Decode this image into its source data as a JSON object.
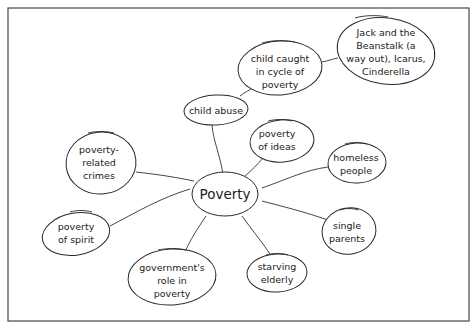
{
  "diagram": {
    "type": "mind-map",
    "center": {
      "id": "poverty",
      "label": "Poverty"
    },
    "nodes": [
      {
        "id": "child-abuse",
        "lines": [
          "child abuse"
        ],
        "parent": "poverty"
      },
      {
        "id": "child-caught",
        "lines": [
          "child caught",
          "in cycle of",
          "poverty"
        ],
        "parent": "child-abuse"
      },
      {
        "id": "fairy-tales",
        "lines": [
          "Jack and the",
          "Beanstalk (a",
          "way out), Icarus,",
          "Cinderella"
        ],
        "parent": "child-caught"
      },
      {
        "id": "poverty-of-ideas",
        "lines": [
          "poverty",
          "of ideas"
        ],
        "parent": "poverty"
      },
      {
        "id": "homeless-people",
        "lines": [
          "homeless",
          "people"
        ],
        "parent": "poverty"
      },
      {
        "id": "single-parents",
        "lines": [
          "single",
          "parents"
        ],
        "parent": "poverty"
      },
      {
        "id": "starving-elderly",
        "lines": [
          "starving",
          "elderly"
        ],
        "parent": "poverty"
      },
      {
        "id": "governments-role",
        "lines": [
          "government's",
          "role in",
          "poverty"
        ],
        "parent": "poverty"
      },
      {
        "id": "poverty-of-spirit",
        "lines": [
          "poverty",
          "of spirit"
        ],
        "parent": "poverty"
      },
      {
        "id": "poverty-related-crimes",
        "lines": [
          "poverty-",
          "related",
          "crimes"
        ],
        "parent": "poverty"
      }
    ]
  }
}
